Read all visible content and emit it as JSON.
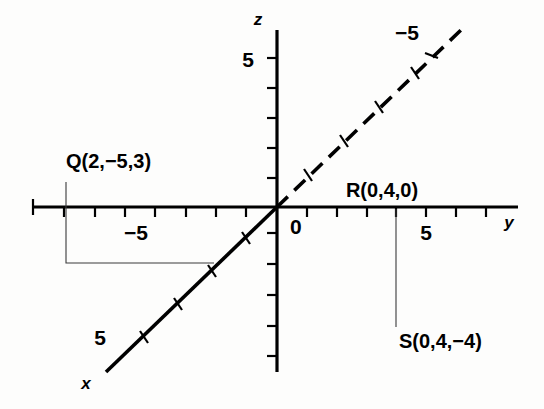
{
  "figure": {
    "background_color": "#fdfdfc",
    "ink_color": "#000000"
  },
  "axes": {
    "x": {
      "name": "x",
      "label_text": "x",
      "tick_label_positive": "5",
      "tick_label_negative": "−5",
      "style_positive": "solid",
      "style_negative": "dashed",
      "description": "diagonal axis running lower-left (positive x, solid) to upper-right (negative x, dashed)"
    },
    "y": {
      "name": "y",
      "label_text": "y",
      "tick_label_positive": "5",
      "tick_label_negative": "−5",
      "style": "solid",
      "description": "horizontal axis"
    },
    "z": {
      "name": "z",
      "label_text": "z",
      "tick_label_positive": "5",
      "style": "solid",
      "description": "vertical axis"
    },
    "origin_label": "0"
  },
  "points": [
    {
      "id": "Q",
      "label": "Q(2,−5,3)",
      "name": "Q",
      "coords": [
        2,
        -5,
        3
      ],
      "has_leader": true
    },
    {
      "id": "R",
      "label": "R(0,4,0)",
      "name": "R",
      "coords": [
        0,
        4,
        0
      ],
      "has_leader": false
    },
    {
      "id": "S",
      "label": "S(0,4,−4)",
      "name": "S",
      "coords": [
        0,
        4,
        -4
      ],
      "has_leader": true
    }
  ],
  "labels": {
    "z_axis_name": "z",
    "z_tick_5": "5",
    "y_axis_name": "y",
    "y_tick_5": "5",
    "y_tick_neg5": "−5",
    "x_axis_name": "x",
    "x_tick_5": "5",
    "x_tick_neg5": "−5",
    "origin": "0",
    "point_q": "Q(2,−5,3)",
    "point_r": "R(0,4,0)",
    "point_s": "S(0,4,−4)"
  }
}
